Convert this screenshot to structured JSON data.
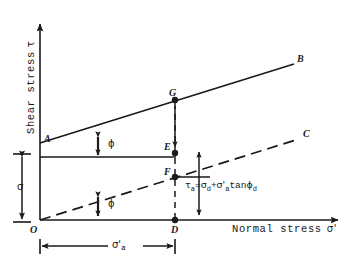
{
  "figure": {
    "type": "mohr-coulomb-shear-strength-envelope-diagram",
    "background_color": "#ffffff",
    "ink_color": "#1a1a1a"
  },
  "axes": {
    "y_title": "Shear stress",
    "y_symbol": "τ",
    "x_title": "Normal stress",
    "x_symbol": "σ'",
    "origin_label": "O"
  },
  "points": [
    {
      "id": "A",
      "label": "A",
      "x": 40,
      "y": 143,
      "note": "intercept of peak envelope on shear axis"
    },
    {
      "id": "B",
      "label": "B",
      "x": 295,
      "y": 63,
      "note": "far end of peak strength envelope"
    },
    {
      "id": "C",
      "label": "C",
      "x": 300,
      "y": 138,
      "note": "far end of dashed drained envelope"
    },
    {
      "id": "D",
      "label": "D",
      "x": 175,
      "y": 220,
      "note": "point on normal stress axis"
    },
    {
      "id": "E",
      "label": "E",
      "x": 175,
      "y": 153,
      "note": "point on vertical through D"
    },
    {
      "id": "F",
      "label": "F",
      "x": 175,
      "y": 177,
      "note": "point on dashed envelope"
    },
    {
      "id": "G",
      "label": "G",
      "x": 175,
      "y": 100,
      "note": "point on solid envelope AB"
    }
  ],
  "lines": [
    {
      "id": "envelope-peak",
      "from": "A",
      "to": "B",
      "style": "solid",
      "label": "A-B"
    },
    {
      "id": "envelope-drained",
      "from": "O",
      "to": "C",
      "style": "dashed",
      "label": "O-C"
    },
    {
      "id": "horizontal-at-A",
      "from": "A",
      "to": "E",
      "style": "solid",
      "label": "horizontal reference through A"
    },
    {
      "id": "vertical-D-G",
      "from": "D",
      "to": "G",
      "style": "dashed",
      "label": "vertical through D"
    }
  ],
  "angles": [
    {
      "id": "phi-at-A",
      "symbol": "ϕ",
      "at": "A",
      "between": [
        "horizontal-at-A",
        "envelope-peak"
      ]
    },
    {
      "id": "phi-at-O",
      "symbol": "ϕ",
      "at": "O",
      "between": [
        "x-axis",
        "envelope-drained"
      ]
    }
  ],
  "dimensions": [
    {
      "id": "sigma-vertical",
      "symbol": "σ",
      "orientation": "vertical",
      "from_y": 145,
      "to_y": 220,
      "note": "cohesion / shear intercept on left of y-axis"
    },
    {
      "id": "sigma-a-prime-horizontal",
      "symbol": "σ'",
      "subscript": "a",
      "orientation": "horizontal",
      "from_x": 40,
      "to_x": 175,
      "note": "effective normal stress from O to D"
    }
  ],
  "arrows": [
    {
      "id": "tau-a-arrow",
      "from": [
        199,
        155
      ],
      "to": [
        199,
        215
      ],
      "note": "double headed arrow spanning E-level to axis"
    }
  ],
  "formula": {
    "id": "tau-a-equation",
    "tau": "τ",
    "tau_sub": "a",
    "eq": "=",
    "sigma_d": "σ",
    "sigma_d_sub": "d",
    "plus": "+",
    "sigma_a": "σ'",
    "sigma_a_sub": "a",
    "tan": "tan",
    "phi": "ϕ",
    "phi_sub": "d",
    "plain_text": "τa = σd + σ'a tanϕd"
  }
}
